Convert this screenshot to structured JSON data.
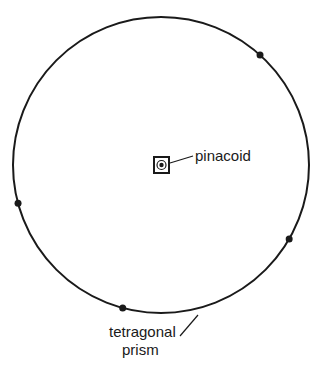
{
  "diagram": {
    "colors": {
      "ink": "#1a1a1a",
      "background": "#ffffff"
    },
    "labels": {
      "pinacoid": "pinacoid",
      "prism_line1": "tetragonal",
      "prism_line2": "prism"
    },
    "poles": [
      {
        "name": "prism-face-pole",
        "azimuth_deg": 312
      },
      {
        "name": "prism-face-pole",
        "azimuth_deg": 30
      },
      {
        "name": "prism-face-pole",
        "azimuth_deg": 165
      },
      {
        "name": "prism-face-pole",
        "azimuth_deg": 105
      }
    ],
    "center_symbol": "tetragonal-axis-square-with-pole"
  }
}
